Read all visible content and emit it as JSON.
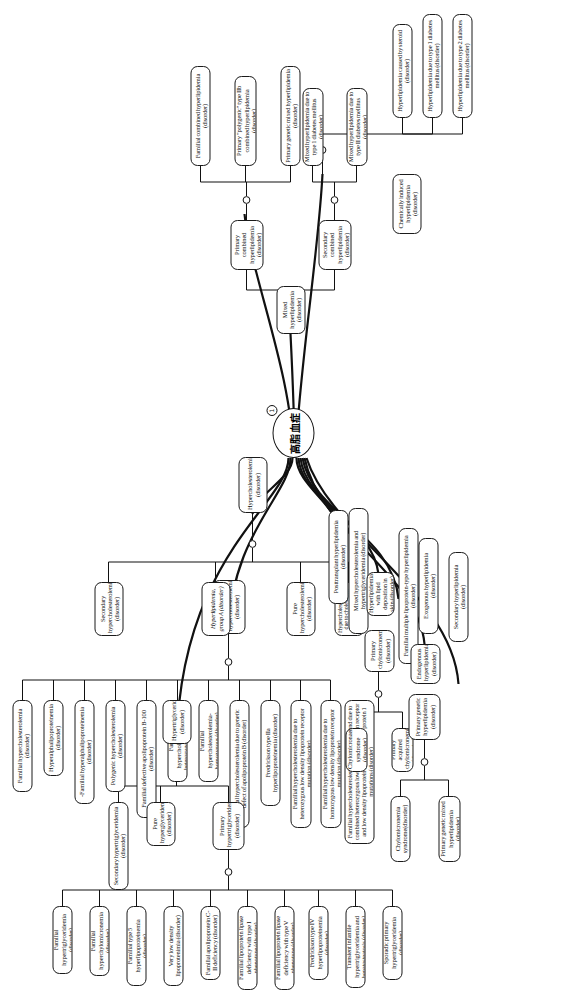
{
  "diagram": {
    "type": "hierarchical-tree",
    "orientation": "rotated-90-counterclockwise",
    "root": {
      "label": "高脂血症",
      "badge": "1",
      "shape": "ellipse"
    },
    "faint_caption": ""
  },
  "nodes": {
    "n_hypercholesterolemia": "Hypercholesterolemia (disorder)",
    "n_secondary_hyperchol": "Secondary hypercholesterolemia (disorder)",
    "n_hyperlipidemia_group_a": "Hyperlipidemia, group A (disorder)",
    "n_primary_hyperchol": "Primary hypercholesterolemia (disorder)",
    "n_fam_hyperchol": "Familial hypercholesterolemia (disorder)",
    "n_hyperalphalipo": "Hyperalphalipoproteinemia (disorder)",
    "n_fam_hyperalphalipo": "-Familial hyperalphalipoproteinemia (disorder)",
    "n_polygenic_hyperchol": "Polygenic hypercholesterolemia (disorder)",
    "n_fam_defective_apob100": "Familial defective apolipoprotein B-100 (disorder)",
    "n_fam_hyperchol_het": "Familial hypercholesterolemia-heterozygous (disorder)",
    "n_fam_hyperchol_hom": "Familial hypercholesterolemia-homozygous (disorder)",
    "n_fam_hyperchol_apob": "Familial hypercholesterolemia due to genetic defect of apolipoprotein B (disorder)",
    "n_fredrickson_iia": "Fredrickson type IIa hyperlipoproteinemia (disorder)",
    "n_fam_hyperchol_het_ldlr": "Familial hypercholesterolemia due to heterozygous low density lipoprotein receptor mutation (disorder)",
    "n_fam_hyperchol_hom_ldlr": "Familial hypercholesterolemia due to homozygous low density lipoprotein receptor mutation (disorder)",
    "n_fam_hyperchol_combined": "Familial hypercholesterolemia co-occurrent and due to combined heterozygous low density lipoprotein receptor and low density lipoprotein receptor adaptor protein 1 mutations (disorder)",
    "n_pure_hyperchol": "Pure hypercholesterolemia (disorder)",
    "n_hyperchol_sitosterol": "Hypercholesterolemia due to cholestenol 7alpha-hydroxylase deficiency (disorder)",
    "n_mixed_hyperlipidemia": "Mixed hyperlipidemia (disorder)",
    "n_primary_combined": "Primary combined hyperlipidemia (disorder)",
    "n_secondary_combined": "Secondary combined hyperlipidemia (disorder)",
    "n_fam_combined_hyperlip": "Familial combined hyperlipidemia (disorder)",
    "n_primary_polygenic_iib": "Primary \"polygenic\" type IIb combined hyperlipidemia (disorder)",
    "n_primary_genetic_mixed": "Primary genetic mixed hyperlipidemia (disorder)",
    "n_mixed_t1dm": "Mixed hyperlipidemia due to type 1 diabetes mellitus (disorder)",
    "n_mixed_t2dm": "Mixed hyperlipidemia due to type II diabetes mellitus (disorder)",
    "n_chem_induced": "Chemically induced hyperlipidemia (disorder)",
    "n_steroid": "Hyperlipidemia caused by steroid (disorder)",
    "n_hyperlip_t1dm": "Hyperlipidemia due to type 1 diabetes mellitus (disorder)",
    "n_hyperlip_t2dm": "Hyperlipidemia due to type 2 diabetes mellitus (disorder)",
    "n_posttransplant": "Posttransplant hyperlipidemia (disorder)",
    "n_mixed_hyperchol_hypertrig": "Mixed hypercholesterolemia and hypertriglyceridemia (disorder)",
    "n_hyperlip_skin": "Hyperlipidemia with lipid deposition in skin (disorder)",
    "n_primary_chylo": "Primary chylomicronemia (disorder)",
    "n_chylo_syndrome": "Chylomicronaemia syndrome (disorder)",
    "n_primary_acquired_chylo": "Primary acquired chylomicronemia (disorder)",
    "n_fam_multiple_lipo": "Familial multiple lipoprotein-type hyperlipidemia (disorder)",
    "n_exogenous_hyperlip": "Exogenous hyperlipidemia (disorder)",
    "n_endogenous_hyperlip": "Endogenous hyperlipidemia (disorder)",
    "n_primary_genetic_hyperlip": "Primary genetic hyperlipidemia (disorder)",
    "n_chylo_syndrome2": "Chylomicronemia syndrome(disorder)",
    "n_primary_genetic_mixed2": "Primary genetic mixed hyperlipidemia (disorder)",
    "n_secondary_hyperlip": "Secondary hyperlipidemia (disorder)",
    "n_hypertriglyceridemia": "Hypertriglyceridemia (disorder)",
    "n_secondary_hypertrig": "Secondary hypertriglyceridemia (disorder)",
    "n_pure_hyperglyceridemia": "Pure hyperglyceridemia (disorder)",
    "n_primary_hypertrig": "Primary hypertriglyceridemia (disorder)",
    "n_fam_hypertrig": "Familial hypertriglyceridemia (disorder)",
    "n_fam_hyperchylo": "Familial hyperchylomicronemia (disorder)",
    "n_fam_type5": "Familial type 5 hyperlipoproteinemia (disorder)",
    "n_vldl": "Very low density lipoprotenimia (disorder)",
    "n_apoc2": "Familial apolipoprotein C-II deficiency (disorder)",
    "n_lpl_type1": "Familial lipoprotein lipase deficiency with type I phenotype (disorder)",
    "n_lpl_type5": "Familial lipoprotein lipase deficiency with type V phenotype (disorder)",
    "n_fredrickson_iv": "Fredrickson type IV hyperlipoproteinemia (disorder)",
    "n_transient_infantile": "Transient infantile hypertriglyceridemia and hepatosteatosis (disorder)",
    "n_sporadic_primary": "Sporadic primary hypertriglyceridemia (disorder)"
  }
}
